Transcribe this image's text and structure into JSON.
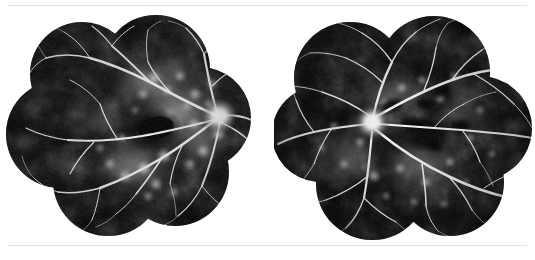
{
  "figure": {
    "background_color": "#ffffff",
    "rule_color": "#e2e2e4",
    "panel_width": 535,
    "panel_height": 260,
    "rule_top_y": 5,
    "rule_bottom_y": 245,
    "caption": ""
  },
  "images": [
    {
      "id": "angiogram-left",
      "name": "fluorescein-angiogram-left-eye",
      "modality": "fluorescein-angiography-montage",
      "eye": "left",
      "alt_text": "Wide-field fluorescein angiography montage of the left eye showing a clover-shaped composite of overlapping circular fundus fields with a hyperfluorescent optic disc, branching retinal vasculature and extensive patchy hyperfluorescent leakage around the posterior pole",
      "montage": {
        "shape": "clover",
        "field_count": 7,
        "center_x": 133,
        "center_y": 119,
        "bounds": {
          "x": 18,
          "y": 22,
          "width": 229,
          "height": 202
        }
      },
      "optic_disc": {
        "x": 215,
        "y": 110,
        "radius": 13,
        "brightness": 0.97
      },
      "macula": {
        "x": 148,
        "y": 124,
        "radius": 26,
        "brightness": 0.05
      },
      "background_color": "#050505",
      "vessel_color": "#f2f2f2",
      "leakage_color": "#dedede",
      "leakage_level": "extensive"
    },
    {
      "id": "angiogram-right",
      "name": "fluorescein-angiogram-right-eye",
      "modality": "fluorescein-angiography-montage",
      "eye": "right",
      "alt_text": "Wide-field fluorescein angiography montage of the right eye showing a clover-shaped composite of overlapping circular fundus fields with a brightly hyperfluorescent optic disc and radiating retinal vessels with scattered hyperfluorescent patches",
      "montage": {
        "shape": "clover",
        "field_count": 7,
        "center_x": 131,
        "center_y": 122,
        "bounds": {
          "x": 14,
          "y": 18,
          "width": 237,
          "height": 208
        }
      },
      "optic_disc": {
        "x": 98,
        "y": 116,
        "radius": 12,
        "brightness": 1.0
      },
      "macula": {
        "x": 150,
        "y": 128,
        "radius": 22,
        "brightness": 0.06
      },
      "background_color": "#050505",
      "vessel_color": "#fafafa",
      "leakage_color": "#d2d2d2",
      "leakage_level": "moderate"
    }
  ]
}
